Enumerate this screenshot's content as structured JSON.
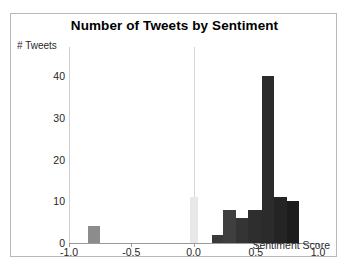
{
  "figure": {
    "border_color": "#b9b9b9",
    "background": "#ffffff"
  },
  "chart_data": {
    "type": "bar",
    "title": "Number of Tweets by Sentiment",
    "xlabel": "Sentiment Score",
    "ylabel": "# Tweets",
    "xlim": [
      -1.0,
      1.0
    ],
    "ylim": [
      0,
      47
    ],
    "grid": false,
    "legend": null,
    "x_tick_labels": [
      "-1.0",
      "-0.5",
      "0.0",
      "0.5",
      "1.0"
    ],
    "x_tick_values": [
      -1.0,
      -0.5,
      0.0,
      0.5,
      1.0
    ],
    "y_tick_labels": [
      "0",
      "10",
      "20",
      "30",
      "40"
    ],
    "y_tick_values": [
      0,
      10,
      20,
      30,
      40
    ],
    "reference_lines": [
      {
        "x": 0.0,
        "color": "#d6d6d6"
      }
    ],
    "bin_width": 0.1,
    "bars": [
      {
        "x0": -0.85,
        "x1": -0.75,
        "value": 4,
        "color": "#8c8c8c"
      },
      {
        "x0": -0.03,
        "x1": 0.04,
        "value": 11,
        "color": "#e8e8e8"
      },
      {
        "x0": 0.15,
        "x1": 0.24,
        "value": 2,
        "color": "#3a3a3a"
      },
      {
        "x0": 0.24,
        "x1": 0.34,
        "value": 8,
        "color": "#3f3f3f"
      },
      {
        "x0": 0.34,
        "x1": 0.44,
        "value": 6,
        "color": "#343434"
      },
      {
        "x0": 0.44,
        "x1": 0.55,
        "value": 8,
        "color": "#2e2e2e"
      },
      {
        "x0": 0.55,
        "x1": 0.65,
        "value": 40,
        "color": "#2b2b2b"
      },
      {
        "x0": 0.65,
        "x1": 0.75,
        "value": 11,
        "color": "#242424"
      },
      {
        "x0": 0.75,
        "x1": 0.85,
        "value": 10,
        "color": "#1c1c1c"
      }
    ]
  }
}
